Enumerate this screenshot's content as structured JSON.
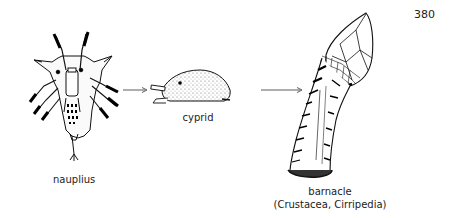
{
  "page_number": "380",
  "stages": [
    {
      "name": "nauplius",
      "label": "nauplius"
    },
    {
      "name": "cyprid",
      "label": "cyprid"
    },
    {
      "name": "barnacle",
      "label": "barnacle",
      "sublabel": "(Crustacea, Cirripedia)"
    }
  ],
  "arrows": [
    {
      "from": "nauplius",
      "to": "cyprid"
    },
    {
      "from": "cyprid",
      "to": "barnacle"
    }
  ]
}
